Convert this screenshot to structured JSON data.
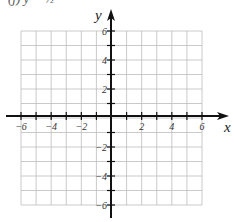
{
  "top_label": "(j)  y = ½",
  "chart_data": {
    "type": "scatter",
    "title": "",
    "xlabel": "x",
    "ylabel": "y",
    "xlim": [
      -6,
      6
    ],
    "ylim": [
      -6,
      6
    ],
    "grid": true,
    "grid_step": 1,
    "x_tick_labels": [
      "-6",
      "-4",
      "-2",
      "2",
      "4",
      "6"
    ],
    "y_tick_labels": [
      "6",
      "4",
      "2",
      "-2",
      "-4",
      "-6"
    ],
    "series": []
  },
  "colors": {
    "grid": "#bdbdbd",
    "axis": "#111111"
  }
}
